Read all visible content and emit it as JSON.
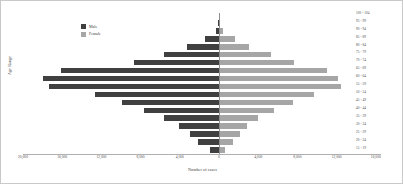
{
  "chart_data": {
    "type": "bar",
    "subtype": "population-pyramid",
    "title": "",
    "xlabel": "Number of cases",
    "ylabel": "Age Range",
    "orientation": "horizontal-diverging",
    "grid": false,
    "legend_position": "top-left",
    "axis_max": 20000,
    "xlim": [
      -20000,
      16000
    ],
    "xticks": [
      "20,000",
      "16,000",
      "12,000",
      "8,000",
      "4,000",
      "0",
      "4,000",
      "8,000",
      "12,000",
      "16,000"
    ],
    "xtick_values": [
      -20000,
      -16000,
      -12000,
      -8000,
      -4000,
      0,
      4000,
      8000,
      12000,
      16000
    ],
    "categories": [
      "100 - 104",
      "95 - 99",
      "90 - 94",
      "85 - 89",
      "80 - 84",
      "75 - 79",
      "70 - 74",
      "65 - 69",
      "60 - 64",
      "55 - 59",
      "50 - 54",
      "45 - 49",
      "40 - 44",
      "35 - 39",
      "30 - 34",
      "25 - 29",
      "20 - 24",
      "15 - 19"
    ],
    "series": [
      {
        "name": "Male",
        "color": "#404040",
        "side": "left",
        "values": [
          0,
          60,
          340,
          1450,
          3250,
          5600,
          8700,
          16100,
          18000,
          17300,
          12700,
          9900,
          7700,
          5600,
          4100,
          3000,
          2100,
          900
        ]
      },
      {
        "name": "Female",
        "color": "#a6a6a6",
        "side": "right",
        "values": [
          0,
          80,
          430,
          1600,
          3100,
          5300,
          7700,
          11000,
          12100,
          12400,
          9700,
          7500,
          5600,
          4000,
          2900,
          2100,
          1400,
          600
        ]
      }
    ]
  },
  "legend": {
    "items": [
      {
        "label": "Male",
        "color": "#404040"
      },
      {
        "label": "Female",
        "color": "#a6a6a6"
      }
    ]
  }
}
